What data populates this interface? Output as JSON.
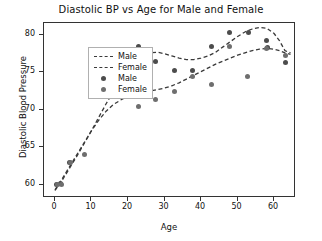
{
  "chart_data": {
    "type": "scatter",
    "title": "Diastolic BP vs Age for Male and Female",
    "xlabel": "Age",
    "ylabel": "Diastolic Blood Pressure",
    "xlim": [
      -3,
      66
    ],
    "ylim": [
      58.2,
      81.6
    ],
    "xticks": [
      0,
      10,
      20,
      30,
      40,
      50,
      60
    ],
    "yticks": [
      60,
      65,
      70,
      75,
      80
    ],
    "grid": false,
    "legend_position": "upper left",
    "legend": [
      {
        "label": "Male",
        "kind": "line",
        "style": "dashed",
        "color": "#3a3a3a"
      },
      {
        "label": "Female",
        "kind": "line",
        "style": "dashed",
        "color": "#3a3a3a"
      },
      {
        "label": "Male",
        "kind": "marker",
        "color": "#4c4c4c"
      },
      {
        "label": "Female",
        "kind": "marker",
        "color": "#6e6e6e"
      }
    ],
    "series": [
      {
        "name": "Male",
        "kind": "scatter",
        "color": "#4c4c4c",
        "x": [
          0.5,
          1.5,
          4.0,
          22.8,
          27.5,
          32.8,
          37.6,
          42.8,
          47.8,
          53.0,
          58.0,
          58.2,
          63.0
        ],
        "y": [
          60.0,
          60.1,
          63.0,
          78.5,
          76.4,
          75.3,
          75.3,
          78.4,
          80.3,
          80.3,
          79.3,
          78.3,
          76.3
        ]
      },
      {
        "name": "Female",
        "kind": "scatter",
        "color": "#6e6e6e",
        "x": [
          0.8,
          1.8,
          4.2,
          8.0,
          14.0,
          22.8,
          27.6,
          32.8,
          37.6,
          42.8,
          47.9,
          52.8,
          58.0,
          63.0
        ],
        "y": [
          60.0,
          60.0,
          62.9,
          64.0,
          72.9,
          70.4,
          71.4,
          72.4,
          74.5,
          73.4,
          78.5,
          74.4,
          78.2,
          77.3
        ]
      },
      {
        "name": "Male",
        "kind": "trend",
        "style": "dashed",
        "color": "#3a3a3a",
        "x": [
          0.0,
          2.0,
          4.0,
          6.0,
          8.0,
          10.0,
          12.0,
          14.0,
          16.0,
          18.0,
          20.0,
          22.0,
          24.0,
          26.0,
          28.0,
          30.0,
          32.0,
          34.0,
          36.0,
          38.0,
          40.0,
          42.0,
          44.0,
          46.0,
          48.0,
          50.0,
          52.0,
          54.0,
          56.0,
          58.0,
          60.0,
          61.5,
          63.0,
          64.5
        ],
        "y": [
          59.2,
          60.6,
          62.2,
          63.8,
          65.5,
          67.2,
          69.0,
          70.8,
          72.5,
          74.1,
          75.4,
          76.5,
          77.2,
          77.6,
          77.7,
          77.5,
          77.2,
          76.9,
          76.7,
          76.7,
          76.9,
          77.2,
          77.7,
          78.4,
          79.1,
          79.8,
          80.4,
          80.8,
          81.0,
          80.9,
          80.2,
          79.2,
          77.9,
          77.6
        ]
      },
      {
        "name": "Female",
        "kind": "trend",
        "style": "dashed",
        "color": "#3a3a3a",
        "x": [
          0.0,
          2.0,
          4.0,
          6.0,
          8.0,
          10.0,
          12.0,
          14.0,
          16.0,
          18.0,
          20.0,
          22.0,
          24.0,
          26.0,
          28.0,
          30.0,
          32.0,
          34.0,
          36.0,
          38.0,
          40.0,
          42.0,
          44.0,
          46.0,
          48.0,
          50.0,
          52.0,
          54.0,
          56.0,
          58.0,
          60.0,
          61.5,
          63.0,
          64.5
        ],
        "y": [
          59.3,
          60.8,
          62.4,
          64.0,
          65.6,
          67.2,
          68.6,
          69.8,
          70.7,
          71.3,
          71.8,
          72.1,
          72.3,
          72.5,
          72.7,
          72.9,
          73.2,
          73.6,
          74.1,
          74.6,
          75.1,
          75.6,
          76.1,
          76.5,
          76.9,
          77.3,
          77.6,
          77.9,
          78.1,
          78.2,
          78.1,
          77.9,
          77.6,
          77.4
        ]
      }
    ]
  }
}
